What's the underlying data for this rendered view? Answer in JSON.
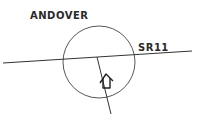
{
  "diagram": {
    "type": "location-sketch",
    "labels": {
      "town": "ANDOVER",
      "road": "SR11"
    },
    "icons": {
      "marker": "house-icon"
    },
    "colors": {
      "stroke": "#333333",
      "background": "#ffffff"
    }
  }
}
